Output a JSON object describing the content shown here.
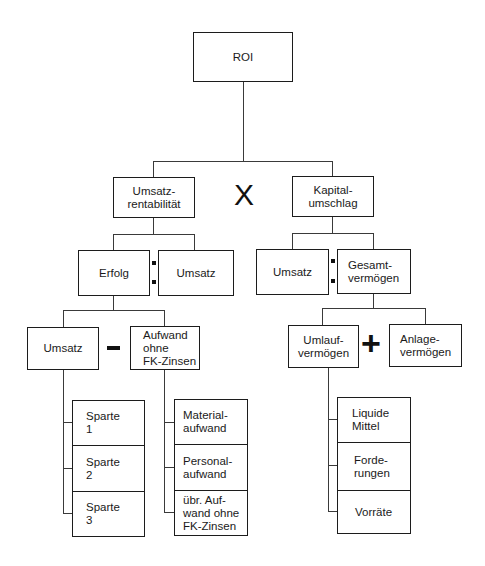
{
  "root": {
    "label": "ROI"
  },
  "level1": {
    "left": {
      "label": "Umsatz-\nrentabilität"
    },
    "operator": "X",
    "right": {
      "label": "Kapital-\numschlag"
    }
  },
  "level2": {
    "left": {
      "numerator": "Erfolg",
      "operator": ":",
      "denominator": "Umsatz"
    },
    "right": {
      "numerator": "Umsatz",
      "operator": ":",
      "denominator": "Gesamt-\nvermögen"
    }
  },
  "level3": {
    "left": {
      "a": "Umsatz",
      "operator": "−",
      "b": "Aufwand\nohne\nFK-Zinsen"
    },
    "right": {
      "a": "Umlauf-\nvermögen",
      "operator": "+",
      "b": "Anlage-\nvermögen"
    }
  },
  "level4": {
    "sparten": [
      "Sparte\n1",
      "Sparte\n2",
      "Sparte\n3"
    ],
    "aufwand": [
      "Material-\naufwand",
      "Personal-\naufwand",
      "übr. Auf-\nwand ohne\nFK-Zinsen"
    ],
    "umlaufvermoegen": [
      "Liquide\nMittel",
      "Forde-\nrungen",
      "Vorräte"
    ]
  }
}
